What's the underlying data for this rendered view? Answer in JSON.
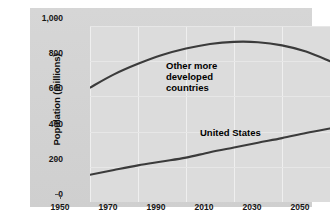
{
  "chart_data": {
    "type": "line",
    "title": "",
    "xlabel": "",
    "ylabel": "Population (millions)",
    "xlim": [
      1950,
      2050
    ],
    "ylim": [
      0,
      1000
    ],
    "grid": true,
    "legend_position": "inline-annotations",
    "xticks": [
      "1950",
      "1970",
      "1990",
      "2010",
      "2030",
      "2050"
    ],
    "xtick_values": [
      1950,
      1970,
      1990,
      2010,
      2030,
      2050
    ],
    "yticks": [
      "0",
      "200",
      "400",
      "600",
      "800",
      "1,000"
    ],
    "ytick_values": [
      0,
      200,
      400,
      600,
      800,
      1000
    ],
    "x": [
      1950,
      1960,
      1970,
      1980,
      1990,
      2000,
      2010,
      2020,
      2030,
      2040,
      2050
    ],
    "series": [
      {
        "name": "Other more developed countries",
        "label": "Other more\ndeveloped\ncountries",
        "color": "#3b3b3b",
        "values": [
          650,
          725,
          785,
          835,
          872,
          898,
          910,
          908,
          890,
          855,
          800
        ]
      },
      {
        "name": "United States",
        "label": "United States",
        "color": "#3b3b3b",
        "values": [
          155,
          182,
          208,
          230,
          252,
          283,
          310,
          337,
          363,
          392,
          418
        ]
      }
    ]
  },
  "chart": {
    "ylabel": "Population (millions)",
    "annotations": {
      "other_more_developed": "Other more\ndeveloped\ncountries",
      "united_states": "United States"
    }
  }
}
